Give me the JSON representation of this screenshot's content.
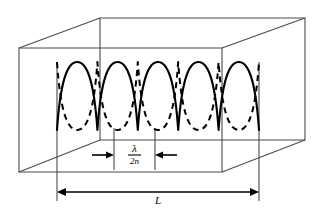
{
  "figure": {
    "type": "physics-diagram",
    "background_color": "#ffffff",
    "line_color": "#000000",
    "box_edge_color": "#555555",
    "cavity": {
      "shape": "rectangular-box-3d",
      "front_face": {
        "left": 19,
        "top": 48,
        "right": 222,
        "bottom": 172
      },
      "rear_face": {
        "left": 100,
        "top": 18,
        "right": 305,
        "bottom": 140
      }
    },
    "waves": {
      "solid": {
        "style": "solid",
        "description": "standing wave mode, solid trace",
        "phase": "cosine",
        "half_wavelengths": 5
      },
      "dashed": {
        "style": "dashed",
        "description": "standing wave mode at opposite phase, dashed trace",
        "phase": "inverted-cosine",
        "half_wavelengths": 5
      },
      "x_start": 57,
      "x_end": 259,
      "center_y": 96,
      "amplitude": 34
    },
    "dimension_half_wavelength": {
      "label_numerator": "λ",
      "label_denominator": "2n",
      "label_plain": "λ/2n",
      "left_tick_x": 114,
      "right_tick_x": 155,
      "baseline_y": 155
    },
    "dimension_length": {
      "label": "L",
      "left_x": 57,
      "right_x": 259,
      "baseline_y": 192
    }
  }
}
